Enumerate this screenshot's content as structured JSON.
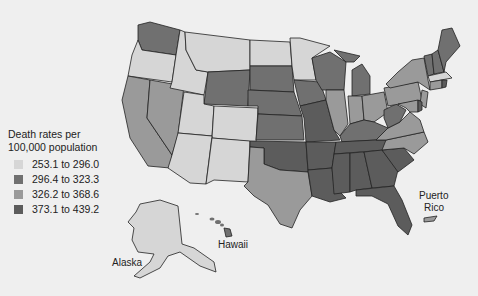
{
  "legend": {
    "title_line1": "Death rates per",
    "title_line2": "100,000 population",
    "items": [
      {
        "label": "253.1 to 296.0",
        "color": "#d6d6d6"
      },
      {
        "label": "296.4 to 323.3",
        "color": "#707070"
      },
      {
        "label": "326.2 to 368.6",
        "color": "#9a9a9a"
      },
      {
        "label": "373.1 to 439.2",
        "color": "#5c5c5c"
      }
    ]
  },
  "labels": {
    "alaska": "Alaska",
    "hawaii": "Hawaii",
    "puerto_rico_1": "Puerto",
    "puerto_rico_2": "Rico"
  },
  "states": {
    "light": [
      "OR",
      "ID",
      "MT",
      "ND",
      "MN",
      "UT",
      "CO",
      "AZ",
      "NM",
      "AK",
      "MA"
    ],
    "medium_dark": [
      "WA",
      "WY",
      "SD",
      "NE",
      "KS",
      "IA",
      "WI",
      "MI",
      "VT",
      "NH",
      "ME",
      "WV",
      "KY",
      "HI"
    ],
    "medium": [
      "CA",
      "NV",
      "TX",
      "IL",
      "IN",
      "OH",
      "PA",
      "NY",
      "VA",
      "NC",
      "NJ",
      "MD",
      "CT",
      "PR"
    ],
    "dark": [
      "OK",
      "MO",
      "AR",
      "LA",
      "MS",
      "AL",
      "TN",
      "GA",
      "SC",
      "FL",
      "DE",
      "RI"
    ]
  }
}
